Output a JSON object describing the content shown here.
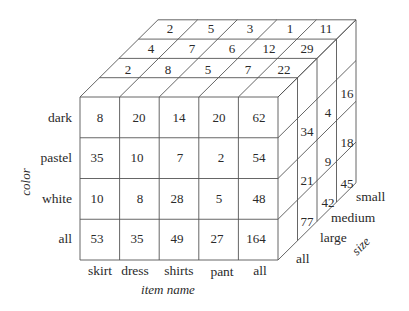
{
  "diagram": {
    "type": "data-cube",
    "axes": {
      "color": {
        "title": "color",
        "labels": [
          "dark",
          "pastel",
          "white",
          "all"
        ]
      },
      "item_name": {
        "title": "item name",
        "labels": [
          "skirt",
          "dress",
          "shirts",
          "pant",
          "all"
        ]
      },
      "size": {
        "title": "size",
        "labels": [
          "all",
          "large",
          "medium",
          "small"
        ]
      }
    },
    "front_face": {
      "rows": [
        [
          "8",
          "20",
          "14",
          "20",
          "62"
        ],
        [
          "35",
          "10",
          "7",
          "2",
          "54"
        ],
        [
          "10",
          "8",
          "28",
          "5",
          "48"
        ],
        [
          "53",
          "35",
          "49",
          "27",
          "164"
        ]
      ]
    },
    "top_face": {
      "rows": [
        [
          "2",
          "5",
          "3",
          "1",
          "11"
        ],
        [
          "4",
          "7",
          "6",
          "12",
          "29"
        ],
        [
          "2",
          "8",
          "5",
          "7",
          "22"
        ]
      ]
    },
    "side_face": {
      "columns": [
        [
          "34",
          "21",
          "77"
        ],
        [
          "4",
          "9",
          "42"
        ],
        [
          "16",
          "18",
          "45"
        ]
      ]
    }
  }
}
